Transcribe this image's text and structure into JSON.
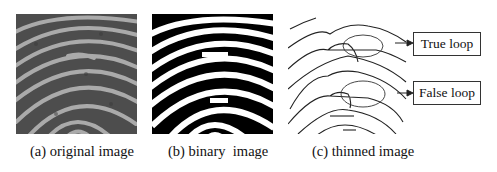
{
  "figure": {
    "panels": [
      {
        "id": "a",
        "caption": "(a) original image",
        "kind": "grayscale fingerprint"
      },
      {
        "id": "b",
        "caption": "(b) binary  image",
        "kind": "binarized fingerprint"
      },
      {
        "id": "c",
        "caption": "(c) thinned image",
        "kind": "thinned ridge skeleton"
      }
    ],
    "annotations": [
      {
        "label": "True loop"
      },
      {
        "label": "False loop"
      }
    ],
    "colors": {
      "ridge_dark": "#000000",
      "gray_bg": "#4a4a4a",
      "gray_ridge": "#b8b8b8",
      "line": "#222222"
    }
  }
}
